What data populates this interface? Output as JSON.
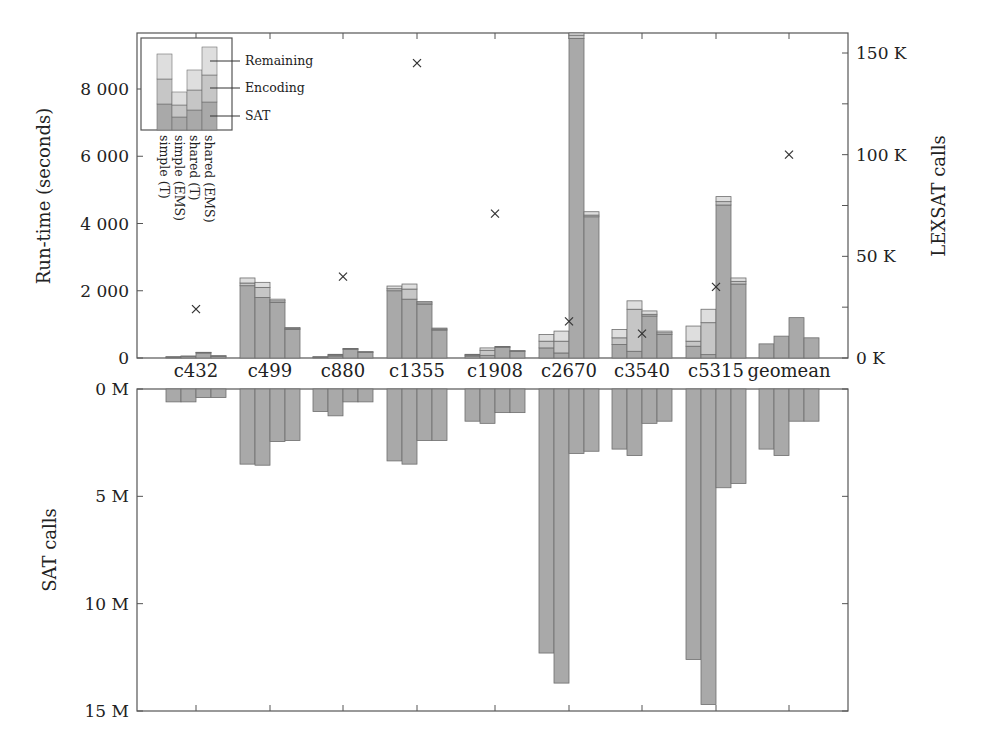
{
  "chart_data": [
    {
      "type": "bar",
      "subtype": "stacked-grouped-with-secondary-scatter",
      "title": "",
      "ylabel": "Run-time (seconds)",
      "y2label": "LEXSAT calls",
      "ylim": [
        0,
        9600
      ],
      "y2lim": [
        0,
        160000
      ],
      "yticks": [
        "0",
        "2 000",
        "4 000",
        "6 000",
        "8 000"
      ],
      "ytick_values": [
        0,
        2000,
        4000,
        6000,
        8000
      ],
      "y2ticks": [
        "0 K",
        "50 K",
        "100 K",
        "150 K"
      ],
      "y2tick_values": [
        0,
        50000,
        100000,
        150000
      ],
      "categories": [
        "c432",
        "c499",
        "c880",
        "c1355",
        "c1908",
        "c2670",
        "c3540",
        "c5315",
        "geomean"
      ],
      "configurations": [
        "simple (T)",
        "simple (EMS)",
        "shared (T)",
        "shared (EMS)"
      ],
      "stack_components": [
        "SAT",
        "Encoding",
        "Remaining"
      ],
      "legend_position": "inset top-left",
      "grid": false,
      "series": [
        {
          "name": "simple (T)",
          "SAT": [
            20,
            2150,
            20,
            2000,
            60,
            300,
            400,
            350,
            420
          ],
          "Encoding": [
            10,
            80,
            10,
            60,
            30,
            200,
            200,
            150,
            0
          ],
          "Remaining": [
            10,
            150,
            10,
            80,
            20,
            200,
            250,
            450,
            0
          ]
        },
        {
          "name": "simple (EMS)",
          "SAT": [
            40,
            1800,
            60,
            1750,
            80,
            150,
            200,
            100,
            650
          ],
          "Encoding": [
            10,
            300,
            30,
            300,
            150,
            350,
            1250,
            950,
            0
          ],
          "Remaining": [
            10,
            150,
            20,
            150,
            70,
            300,
            250,
            400,
            0
          ]
        },
        {
          "name": "shared (T)",
          "SAT": [
            150,
            1650,
            260,
            1600,
            320,
            9500,
            1250,
            4550,
            1200
          ],
          "Encoding": [
            10,
            50,
            10,
            40,
            10,
            100,
            50,
            100,
            0
          ],
          "Remaining": [
            10,
            50,
            10,
            40,
            10,
            200,
            100,
            150,
            0
          ]
        },
        {
          "name": "shared (EMS)",
          "SAT": [
            50,
            850,
            170,
            830,
            200,
            4200,
            700,
            2200,
            600
          ],
          "Encoding": [
            10,
            30,
            10,
            30,
            10,
            50,
            50,
            80,
            0
          ],
          "Remaining": [
            10,
            30,
            10,
            30,
            10,
            100,
            50,
            100,
            0
          ]
        }
      ],
      "lexsat_calls": {
        "name": "LEXSAT calls (×)",
        "axis": "right",
        "values": [
          24000,
          0,
          40000,
          145000,
          71000,
          18000,
          12000,
          35000,
          100000
        ],
        "note": "c499 has no visible marker"
      }
    },
    {
      "type": "bar",
      "subtype": "grouped-inverted",
      "title": "",
      "ylabel": "SAT calls",
      "ylim": [
        0,
        15000000
      ],
      "yticks": [
        "0 M",
        "5 M",
        "10 M",
        "15 M"
      ],
      "ytick_values": [
        0,
        5000000,
        10000000,
        15000000
      ],
      "categories": [
        "c432",
        "c499",
        "c880",
        "c1355",
        "c1908",
        "c2670",
        "c3540",
        "c5315",
        "geomean"
      ],
      "grid": false,
      "series": [
        {
          "name": "simple (T)",
          "values": [
            600000,
            3500000,
            1050000,
            3350000,
            1500000,
            12300000,
            2800000,
            12600000,
            2800000
          ]
        },
        {
          "name": "simple (EMS)",
          "values": [
            600000,
            3550000,
            1250000,
            3500000,
            1600000,
            13700000,
            3100000,
            14700000,
            3100000
          ]
        },
        {
          "name": "shared (T)",
          "values": [
            400000,
            2450000,
            600000,
            2400000,
            1100000,
            3000000,
            1600000,
            4600000,
            1500000
          ]
        },
        {
          "name": "shared (EMS)",
          "values": [
            400000,
            2400000,
            600000,
            2400000,
            1100000,
            2900000,
            1500000,
            4400000,
            1500000
          ]
        }
      ]
    }
  ],
  "legend": {
    "labels": [
      "Remaining",
      "Encoding",
      "SAT"
    ],
    "config_labels": [
      "simple (T)",
      "simple (EMS)",
      "shared (T)",
      "shared (EMS)"
    ]
  },
  "colors": {
    "sat": "#a9a9a9",
    "encoding": "#c6c6c6",
    "remaining": "#dedede",
    "bar_stroke": "#6e6e6e",
    "axis": "#555555",
    "marker": "#333333"
  }
}
